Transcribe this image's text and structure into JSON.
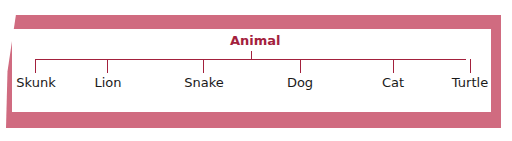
{
  "diagram": {
    "type": "tree",
    "root": "Animal",
    "children": [
      "Skunk",
      "Lion",
      "Snake",
      "Dog",
      "Cat",
      "Turtle"
    ],
    "colors": {
      "frame": "#d06b80",
      "connector": "#a3213d",
      "root_text": "#a3213d",
      "leaf_text": "#1a1a1a"
    }
  }
}
